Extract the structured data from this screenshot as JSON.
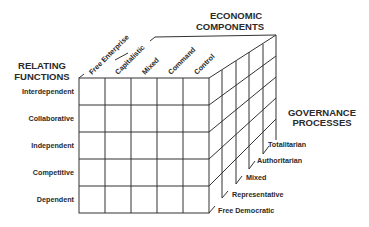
{
  "diagram": {
    "type": "3d-cube-matrix",
    "axes": {
      "rows": {
        "title_line1": "RELATING",
        "title_line2": "FUNCTIONS",
        "labels": [
          "Interdependent",
          "Collaborative",
          "Independent",
          "Competitive",
          "Dependent"
        ]
      },
      "columns": {
        "title_line1": "ECONOMIC",
        "title_line2": "COMPONENTS",
        "labels": [
          "Free Enterprise",
          "Capitalistic",
          "Mixed",
          "Command",
          "Control"
        ]
      },
      "depth": {
        "title_line1": "GOVERNANCE",
        "title_line2": "PROCESSES",
        "labels": [
          "Free Democratic",
          "Representative",
          "Mixed",
          "Authoritarian",
          "Totalitarian"
        ]
      }
    },
    "colors": {
      "line": "#333333",
      "text": "#2a2a2a",
      "background": "#ffffff"
    }
  }
}
